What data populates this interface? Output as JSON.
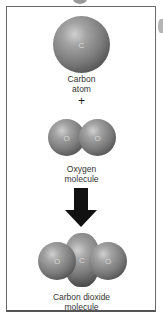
{
  "diagram": {
    "carbon_atom": {
      "symbol": "C",
      "label_line1": "Carbon",
      "label_line2": "atom"
    },
    "plus": "+",
    "oxygen_molecule": {
      "symbols": [
        "O",
        "O"
      ],
      "label_line1": "Oxygen",
      "label_line2": "molecule"
    },
    "arrow": "down-arrow",
    "carbon_dioxide_molecule": {
      "symbols": [
        "O",
        "C",
        "O"
      ],
      "label_line1": "Carbon dioxide",
      "label_line2": "molecule"
    }
  }
}
